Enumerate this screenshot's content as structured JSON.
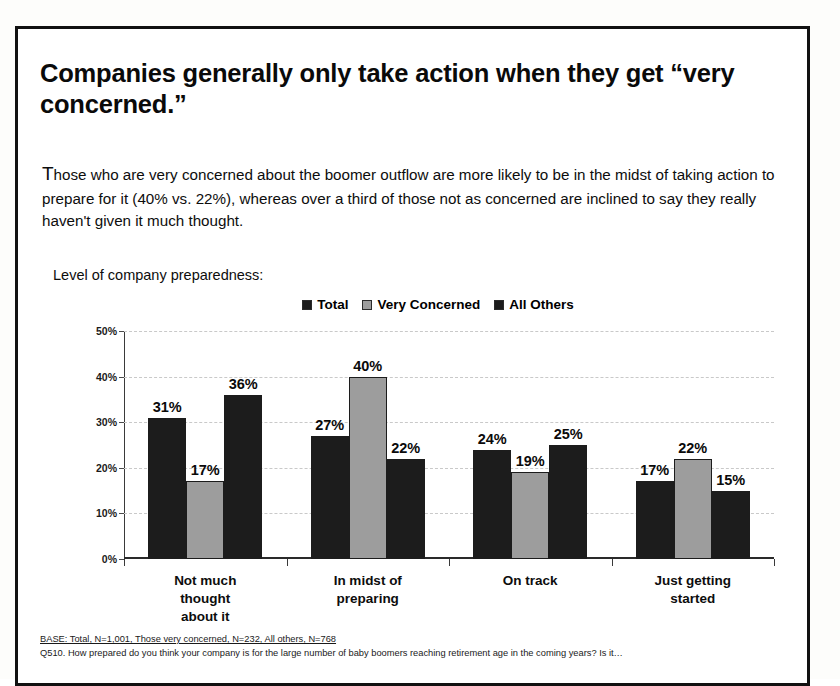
{
  "slide": {
    "title": "Companies generally only take action when they get “very concerned.”",
    "body_dropcap": "T",
    "body_rest": "hose who are very concerned about the boomer outflow are more likely to be in the midst of taking action to prepare for it (40% vs. 22%), whereas over a third of those not as concerned are inclined to say they really haven't given it much thought.",
    "chart_caption": "Level of company preparedness:",
    "footnote_base": "BASE: Total, N=1,001, Those very concerned, N=232, All others, N=768",
    "footnote_question": "Q510. How prepared do you think your company is for the large number of baby boomers reaching retirement age in the coming years? Is it…"
  },
  "colors": {
    "total": "#1c1c1c",
    "very_concerned": "#9d9d9d",
    "all_others": "#1c1c1c",
    "frame": "#111111",
    "gridline": "#c9c9c9"
  },
  "chart_data": {
    "type": "bar",
    "title": "Level of company preparedness:",
    "xlabel": "",
    "ylabel": "",
    "ylim": [
      0,
      50
    ],
    "ytick_labels": [
      "50%",
      "40%",
      "30%",
      "20%",
      "10%",
      "0%"
    ],
    "ytick_values": [
      50,
      40,
      30,
      20,
      10,
      0
    ],
    "grid": true,
    "legend_position": "top-center",
    "categories": [
      "Not much\nthought about it",
      "In midst of\npreparing",
      "On track",
      "Just getting started"
    ],
    "series": [
      {
        "name": "Total",
        "values": [
          31,
          27,
          24,
          17
        ],
        "labels": [
          "31%",
          "27%",
          "24%",
          "17%"
        ]
      },
      {
        "name": "Very Concerned",
        "values": [
          17,
          40,
          19,
          22
        ],
        "labels": [
          "17%",
          "40%",
          "19%",
          "22%"
        ]
      },
      {
        "name": "All Others",
        "values": [
          36,
          22,
          25,
          15
        ],
        "labels": [
          "36%",
          "22%",
          "25%",
          "15%"
        ]
      }
    ]
  }
}
